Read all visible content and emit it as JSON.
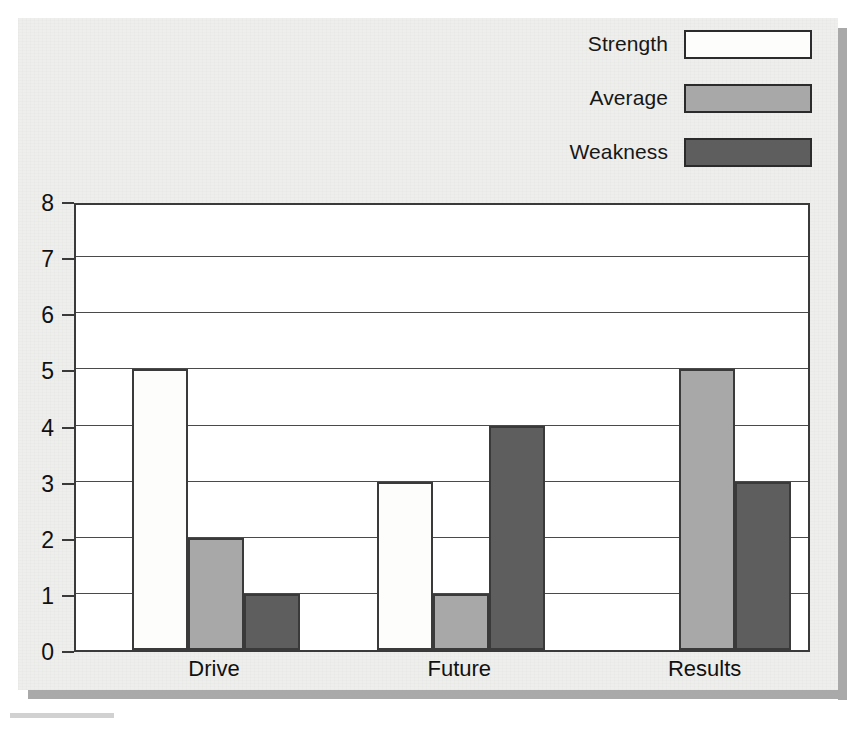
{
  "figure": {
    "background_color": "#eeeeec",
    "frame_shadow_color": "#a9a9a9",
    "plot_background": "#ffffff",
    "axis_color": "#3a3a3a"
  },
  "legend": {
    "position": "top-right",
    "items": [
      {
        "label": "Strength",
        "color": "#fdfdfb"
      },
      {
        "label": "Average",
        "color": "#a8a8a8"
      },
      {
        "label": "Weakness",
        "color": "#5e5e5e"
      }
    ]
  },
  "chart_data": {
    "type": "bar",
    "title": "",
    "subtitle": "",
    "xlabel": "",
    "ylabel": "",
    "categories": [
      "Drive",
      "Future",
      "Results"
    ],
    "series": [
      {
        "name": "Strength",
        "color": "#fdfdfb",
        "values": [
          5,
          3,
          0
        ]
      },
      {
        "name": "Average",
        "color": "#a8a8a8",
        "values": [
          2,
          1,
          5
        ]
      },
      {
        "name": "Weakness",
        "color": "#5e5e5e",
        "values": [
          1,
          4,
          3
        ]
      }
    ],
    "ylim": [
      0,
      8
    ],
    "yticks": [
      0,
      1,
      2,
      3,
      4,
      5,
      6,
      7,
      8
    ],
    "ytick_labels": [
      "0",
      "1",
      "2",
      "3",
      "4",
      "5",
      "6",
      "7",
      "8"
    ],
    "grid": true,
    "grid_axis": "y",
    "legend_position": "top-right",
    "bar_group_layout": "adjacent",
    "annotations": []
  },
  "layout": {
    "group_slot_width": 245.3,
    "bar_width": 56,
    "group_first_bar_offset": 56
  }
}
